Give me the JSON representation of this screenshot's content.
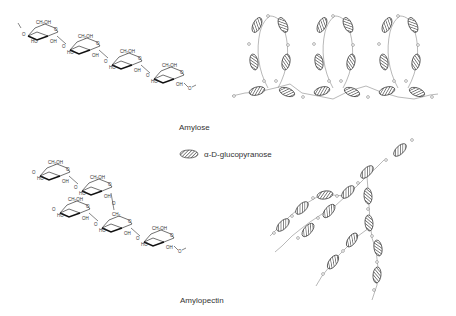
{
  "labels": {
    "amylose": "Amylose",
    "amylopectin": "Amylopectin"
  },
  "legend": {
    "symbol": "hatched-ellipse",
    "text": "α-D-glucopyranose"
  },
  "chem": {
    "ch2oh": "CH₂OH",
    "ho": "HO",
    "oh": "OH",
    "o": "O",
    "ch2": "CH₂"
  },
  "colors": {
    "stroke": "#333333",
    "hatch": "#555555",
    "text": "#333333",
    "background": "#ffffff"
  }
}
